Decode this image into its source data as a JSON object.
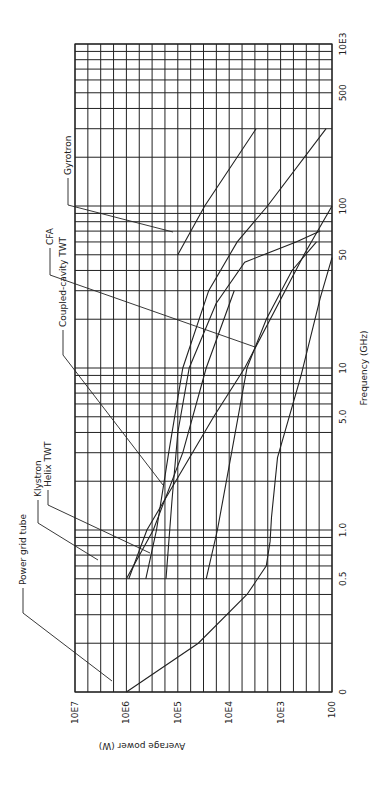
{
  "chart_data": {
    "type": "line",
    "title": "",
    "orientation": "rotated 90deg clockwise (frequency runs bottom-to-top, power runs left-to-right decreasing)",
    "xlabel": "Frequency (GHz)",
    "ylabel": "Average power (W)",
    "x_scale": "log",
    "y_scale": "log",
    "xlim": [
      0.1,
      1000
    ],
    "ylim": [
      100,
      10000000
    ],
    "grid": true,
    "x_tick_labels": [
      "0",
      "0.5",
      "1.0",
      "5.0",
      "10",
      "50",
      "100",
      "500",
      "10E3"
    ],
    "x_tick_values": [
      0.1,
      0.5,
      1.0,
      5.0,
      10,
      50,
      100,
      500,
      1000
    ],
    "y_tick_labels": [
      "10E7",
      "10E6",
      "10E5",
      "10E4",
      "10E3",
      "100"
    ],
    "y_tick_values": [
      10000000,
      1000000,
      100000,
      10000,
      1000,
      100
    ],
    "series": [
      {
        "name": "Power grid tube",
        "points": [
          [
            0.1,
            1000000
          ],
          [
            0.2,
            40000
          ],
          [
            0.4,
            4500
          ],
          [
            0.6,
            1900
          ],
          [
            0.85,
            1600
          ],
          [
            1.2,
            1500
          ],
          [
            2.8,
            1150
          ],
          [
            9,
            400
          ],
          [
            27,
            170
          ],
          [
            48,
            100
          ]
        ]
      },
      {
        "name": "Klystron",
        "points": [
          [
            0.5,
            420000
          ],
          [
            1.0,
            260000
          ],
          [
            3.0,
            150000
          ],
          [
            10,
            80000
          ],
          [
            30,
            25000
          ],
          [
            60,
            7000
          ],
          [
            100,
            1800
          ],
          [
            300,
            130
          ]
        ]
      },
      {
        "name": "Helix TWT",
        "points": [
          [
            0.5,
            28000
          ],
          [
            1.0,
            17000
          ],
          [
            3.0,
            9000
          ],
          [
            10,
            4500
          ],
          [
            20,
            1900
          ],
          [
            40,
            600
          ],
          [
            60,
            200
          ]
        ]
      },
      {
        "name": "Coupled-cavity TWT",
        "points": [
          [
            0.5,
            170000
          ],
          [
            1.5,
            130000
          ],
          [
            4,
            100000
          ],
          [
            10,
            60000
          ],
          [
            25,
            18000
          ],
          [
            45,
            5000
          ],
          [
            60,
            500
          ],
          [
            70,
            170
          ]
        ]
      },
      {
        "name": "CFA",
        "points": [
          [
            0.5,
            1000000
          ],
          [
            1.0,
            300000
          ],
          [
            3,
            80000
          ],
          [
            10,
            28000
          ],
          [
            30,
            8000
          ]
        ]
      },
      {
        "name": "Gyrotron",
        "points": [
          [
            50,
            100000
          ],
          [
            100,
            30000
          ],
          [
            300,
            3000
          ]
        ]
      },
      {
        "name": "Linear (low-power envelope)",
        "points": [
          [
            0.5,
            900000
          ],
          [
            1.0,
            400000
          ],
          [
            5.0,
            20000
          ],
          [
            10,
            5000
          ],
          [
            50,
            350
          ],
          [
            100,
            100
          ]
        ]
      }
    ],
    "annotations": [
      "Power grid tube",
      "Klystron",
      "Helix TWT",
      "Coupled-cavity TWT",
      "CFA",
      "Gyrotron"
    ],
    "legend": "none (leader-line labels along left edge)"
  },
  "labels": {
    "power_grid_tube": "Power grid tube",
    "klystron": "Klystron",
    "helix_twt": "Helix TWT",
    "coupled_cavity_twt": "Coupled-cavity TWT",
    "cfa": "CFA",
    "gyrotron": "Gyrotron",
    "xlabel": "Frequency (GHz)",
    "ylabel": "Average power (W)",
    "freq_ticks": [
      "0",
      "0.5",
      "1.0",
      "5.0",
      "10",
      "50",
      "100",
      "500",
      "10E3"
    ],
    "power_ticks": [
      "10E7",
      "10E6",
      "10E5",
      "10E4",
      "10E3",
      "100"
    ]
  }
}
